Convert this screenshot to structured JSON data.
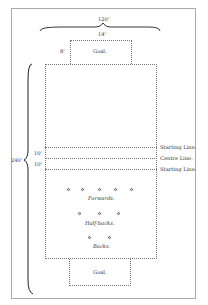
{
  "diagram": {
    "dimensions": {
      "width_total": "120'",
      "goal_width": "14'",
      "goal_depth": "8'",
      "length_total": "240'",
      "starting_to_centre_upper": "10'",
      "starting_to_centre_lower": "10'"
    },
    "goals": {
      "top": "Goal.",
      "bottom": "Goal."
    },
    "lines": {
      "starting_upper": "Starting Line.",
      "centre": "Centre Line.",
      "starting_lower": "Starting Line."
    },
    "positions": {
      "forwards": {
        "label": "Forwards.",
        "count": 5
      },
      "half_backs": {
        "label": "Half-backs.",
        "count": 3
      },
      "backs": {
        "label": "Backs.",
        "count": 2
      }
    }
  }
}
